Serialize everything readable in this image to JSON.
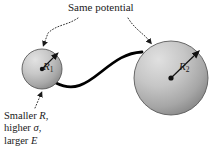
{
  "figure": {
    "kind": "physics-diagram",
    "background_color": "#ffffff"
  },
  "annotations": {
    "title": "Same potential",
    "caption_lines": [
      {
        "prefix": "Smaller ",
        "symbol": "R",
        "suffix": ","
      },
      {
        "prefix": "higher ",
        "symbol": "σ",
        "suffix": ","
      },
      {
        "prefix": "larger ",
        "symbol": "E",
        "suffix": ""
      }
    ]
  },
  "spheres": [
    {
      "id": "small-sphere",
      "radius_label": "R",
      "radius_subscript": "1",
      "cx": 42,
      "cy": 69,
      "r": 20,
      "fill_light": "#d6d6d6",
      "fill_dark": "#8e8e8e"
    },
    {
      "id": "large-sphere",
      "radius_label": "R",
      "radius_subscript": "2",
      "cx": 171,
      "cy": 78,
      "r": 37,
      "fill_light": "#d6d6d6",
      "fill_dark": "#8e8e8e"
    }
  ],
  "wire": {
    "id": "connecting-wire",
    "color": "#000000",
    "stroke_width": 2.6
  },
  "leaders": [
    {
      "id": "leader-left",
      "target": "small-sphere-top"
    },
    {
      "id": "leader-right",
      "target": "large-sphere-upper-left"
    },
    {
      "id": "leader-bottom",
      "target": "small-sphere-bottom"
    }
  ],
  "colors": {
    "ink": "#1a1a1a",
    "line": "#000000",
    "sphere_edge": "#555555"
  }
}
